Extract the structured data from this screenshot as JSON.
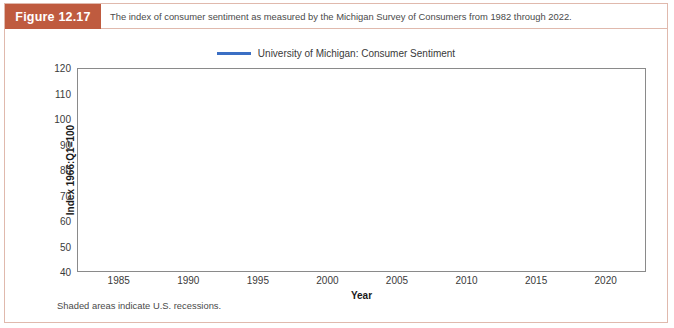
{
  "figure": {
    "number_label": "Figure 12.17",
    "caption": "The index of consumer sentiment as measured by the Michigan Survey of Consumers from 1982 through 2022.",
    "footnote": "Shaded areas indicate U.S. recessions.",
    "accent_color": "#bf5b3f",
    "border_color": "#e0b9ad"
  },
  "legend": {
    "entries": [
      {
        "label": "University of Michigan: Consumer Sentiment",
        "color": "#3b6fc4"
      }
    ]
  },
  "chart_data": {
    "type": "line",
    "title": "",
    "xlabel": "Year",
    "ylabel": "Index 1966:Q1=100",
    "xlim": [
      1982.0,
      2022.9
    ],
    "ylim": [
      40,
      120
    ],
    "ytick_values": [
      40,
      50,
      60,
      70,
      80,
      90,
      100,
      110,
      120
    ],
    "xtick_values": [
      1985,
      1990,
      1995,
      2000,
      2005,
      2010,
      2015,
      2020
    ],
    "grid": true,
    "legend_position": "above-plot-center",
    "line_color": "#3b6fc4",
    "line_width": 1.6,
    "shaded_band_color": "#e8ecf0",
    "recession_bands": [
      {
        "start": 1990.5,
        "end": 1991.2
      },
      {
        "start": 2001.2,
        "end": 2001.9
      },
      {
        "start": 2007.95,
        "end": 2009.45
      },
      {
        "start": 2020.15,
        "end": 2020.35
      }
    ],
    "series": [
      {
        "name": "University of Michigan: Consumer Sentiment",
        "x_start": 1982.0,
        "x_step": 0.0833,
        "values": [
          71,
          72,
          68,
          70,
          72,
          71,
          72,
          73,
          71,
          74,
          72,
          71,
          74,
          80,
          88,
          89,
          92,
          92,
          90,
          91,
          90,
          89,
          91,
          94,
          97,
          98,
          100,
          99,
          101,
          96,
          97,
          98,
          101,
          96,
          94,
          95,
          96,
          93,
          94,
          93,
          96,
          95,
          93,
          92,
          92,
          91,
          90,
          94,
          91,
          90,
          92,
          94,
          95,
          96,
          97,
          92,
          95,
          92,
          90,
          91,
          92,
          90,
          94,
          95,
          93,
          92,
          94,
          91,
          88,
          90,
          87,
          86,
          92,
          93,
          94,
          95,
          92,
          91,
          84,
          88,
          91,
          92,
          90,
          93,
          97,
          95,
          93,
          95,
          97,
          94,
          93,
          90,
          94,
          95,
          96,
          98,
          93,
          91,
          93,
          94,
          98,
          93,
          88,
          76,
          72,
          68,
          66,
          65,
          68,
          74,
          74,
          78,
          78,
          79,
          74,
          77,
          76,
          80,
          70,
          69,
          68,
          68,
          69,
          70,
          72,
          78,
          78,
          77,
          76,
          74,
          77,
          79,
          87,
          86,
          89,
          86,
          87,
          90,
          88,
          88,
          86,
          85,
          82,
          82,
          89,
          88,
          91,
          92,
          89,
          92,
          90,
          95,
          88,
          90,
          91,
          93,
          90,
          88,
          90,
          92,
          89,
          94,
          95,
          95,
          96,
          96,
          94,
          96,
          97,
          99,
          100,
          105,
          104,
          100,
          104,
          104,
          106,
          105,
          107,
          103,
          106,
          111,
          107,
          108,
          106,
          105,
          104,
          104,
          107,
          105,
          107,
          112,
          112,
          111,
          106,
          109,
          110,
          106,
          108,
          107,
          106,
          105,
          107,
          98,
          94,
          90,
          91,
          88,
          92,
          92,
          92,
          91,
          81,
          82,
          83,
          88,
          86,
          90,
          96,
          93,
          96,
          92,
          88,
          87,
          86,
          80,
          84,
          79,
          82,
          77,
          77,
          93,
          94,
          89,
          90,
          89,
          87,
          92,
          95,
          94,
          103,
          94,
          95,
          94,
          90,
          96,
          96,
          89,
          94,
          92,
          92,
          97,
          95,
          94,
          92,
          87,
          86,
          82,
          96,
          89,
          76,
          74,
          81,
          91,
          91,
          86,
          79,
          87,
          79,
          84,
          96,
          89,
          85,
          74,
          81,
          91,
          96,
          91,
          88,
          87,
          79,
          85,
          90,
          83,
          83,
          75,
          76,
          75,
          78,
          70,
          69,
          62,
          58,
          56,
          61,
          63,
          70,
          57,
          55,
          60,
          61,
          56,
          57,
          65,
          68,
          70,
          66,
          65,
          73,
          70,
          67,
          72,
          74,
          76,
          73,
          72,
          76,
          76,
          67,
          68,
          68,
          67,
          71,
          74,
          74,
          78,
          67,
          69,
          74,
          71,
          63,
          55,
          59,
          60,
          64,
          69,
          75,
          75,
          76,
          76,
          79,
          73,
          72,
          74,
          78,
          82,
          82,
          72,
          73,
          77,
          78,
          76,
          84,
          82,
          85,
          82,
          77,
          73,
          75,
          82,
          81,
          95,
          93,
          95,
          90,
          94,
          81,
          82,
          84,
          87,
          88,
          93,
          98,
          95,
          91,
          89,
          94,
          92,
          90,
          89,
          87,
          90,
          93,
          98,
          98,
          96,
          96,
          97,
          94,
          95,
          93,
          96,
          95,
          100,
          98,
          95,
          95,
          99,
          101,
          98,
          97,
          95,
          98,
          96,
          100,
          100,
          98,
          98,
          91,
          96,
          97,
          97,
          100,
          98,
          98,
          89,
          93,
          95,
          96,
          99,
          99,
          95,
          89,
          71,
          72,
          78,
          72,
          74,
          80,
          81,
          77,
          80,
          79,
          76,
          84,
          88,
          82,
          85,
          81,
          70,
          72,
          71,
          67,
          67,
          70,
          62,
          59,
          65,
          58,
          50,
          51,
          58,
          58,
          59,
          56,
          59
        ]
      }
    ]
  }
}
